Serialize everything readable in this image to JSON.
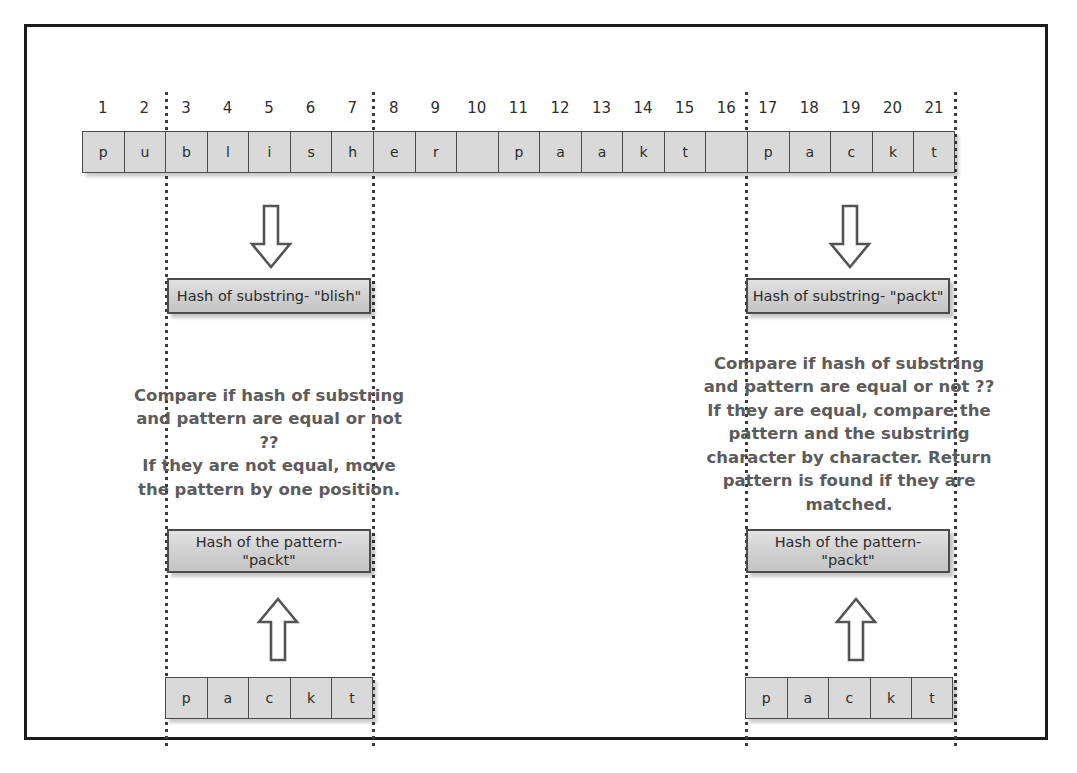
{
  "figure": {
    "text_color": "#5c5c5c",
    "cell_fill": "#d9d9d9",
    "border_color": "#4a4a4a",
    "frame_color": "#1a1a1a"
  },
  "text_strip": {
    "indices": [
      "1",
      "2",
      "3",
      "4",
      "5",
      "6",
      "7",
      "8",
      "9",
      "10",
      "11",
      "12",
      "13",
      "14",
      "15",
      "16",
      "17",
      "18",
      "19",
      "20",
      "21"
    ],
    "characters": [
      "p",
      "u",
      "b",
      "l",
      "i",
      "s",
      "h",
      "e",
      "r",
      "",
      "p",
      "a",
      "a",
      "k",
      "t",
      "",
      "p",
      "a",
      "c",
      "k",
      "t"
    ],
    "full_text": "publisher paakt packt"
  },
  "guides": {
    "labels": [
      "guide-at-index-3",
      "guide-at-index-8",
      "guide-at-index-17",
      "guide-at-index-21-end"
    ]
  },
  "left_column": {
    "window_label": "window-positions-3-to-7",
    "down_arrow": "down-arrow",
    "substring_hash_box": "Hash of substring- \"blish\"",
    "note_lines": [
      "Compare if hash of substring",
      "and pattern are equal or not ??",
      "If they are not equal, move",
      "the pattern by one position."
    ],
    "pattern_hash_box_lines": [
      "Hash of the pattern-",
      "\"packt\""
    ],
    "up_arrow": "up-arrow",
    "pattern_cells": [
      "p",
      "a",
      "c",
      "k",
      "t"
    ]
  },
  "right_column": {
    "window_label": "window-positions-17-to-21",
    "down_arrow": "down-arrow",
    "substring_hash_box": "Hash of substring- \"packt\"",
    "note_lines": [
      "Compare if hash of substring",
      "and pattern are equal or not ??",
      "If they are equal, compare the",
      "pattern and the substring",
      "character by character. Return",
      "pattern is found if they are",
      "matched."
    ],
    "pattern_hash_box_lines": [
      "Hash of the pattern-",
      "\"packt\""
    ],
    "up_arrow": "up-arrow",
    "pattern_cells": [
      "p",
      "a",
      "c",
      "k",
      "t"
    ]
  }
}
